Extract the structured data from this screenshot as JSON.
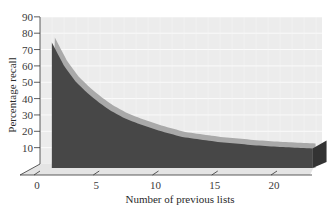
{
  "chart_data": {
    "type": "area",
    "title": "",
    "xlabel": "Number of previous lists",
    "ylabel": "Percentage recall",
    "x_ticks": [
      0,
      5,
      10,
      15,
      20
    ],
    "y_ticks": [
      10,
      20,
      30,
      40,
      50,
      60,
      70,
      80,
      90
    ],
    "xlim": [
      0,
      24
    ],
    "ylim": [
      0,
      90
    ],
    "grid": true,
    "legend": null,
    "three_d": true,
    "x": [
      1,
      2,
      3,
      4,
      5,
      6,
      7,
      8,
      10,
      12,
      15,
      18,
      20,
      23
    ],
    "series": [
      {
        "name": "Percentage recall",
        "values": [
          77,
          63,
          53,
          46,
          40,
          35,
          31,
          28,
          23,
          19,
          16,
          14,
          13,
          12
        ]
      }
    ]
  },
  "colors": {
    "front_face": "#4a4a4a",
    "top_band": "#a8a8a8",
    "back_wall": "#ececec",
    "floor": "#e2e2e2",
    "grid": "#ffffff",
    "axis": "#333333"
  }
}
